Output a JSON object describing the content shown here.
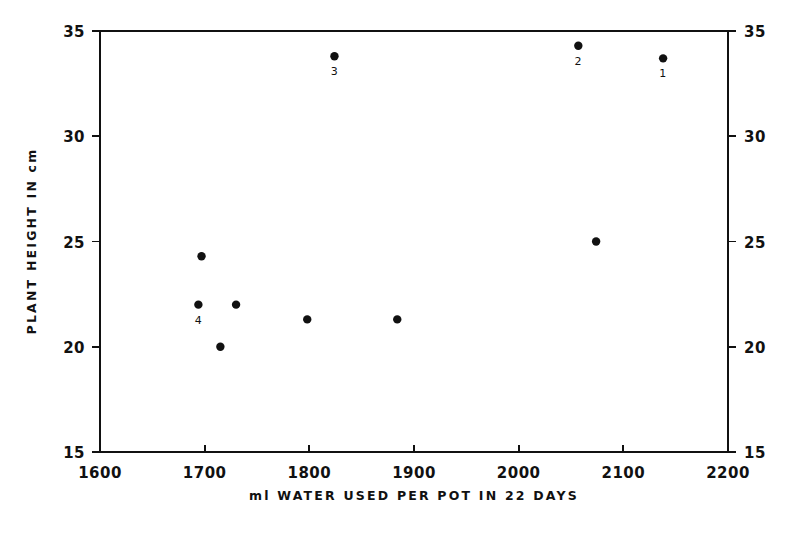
{
  "chart_data": {
    "type": "scatter",
    "title": "",
    "xlabel": "ml WATER USED PER POT IN 22 DAYS",
    "ylabel": "PLANT HEIGHT IN cm",
    "xlim": [
      1600,
      2200
    ],
    "ylim": [
      15,
      35
    ],
    "xticks": [
      1600,
      1700,
      1800,
      1900,
      2000,
      2100,
      2200
    ],
    "xticklabels": [
      "1600",
      "1700",
      "1800",
      "1900",
      "2000",
      "2100",
      "2200"
    ],
    "yticks": [
      15,
      20,
      25,
      30,
      35
    ],
    "yticklabels": [
      "15",
      "20",
      "25",
      "30",
      "35"
    ],
    "yticklabels_right": [
      "15",
      "20",
      "25",
      "30",
      "35"
    ],
    "grid": false,
    "legend": null,
    "marker_color": "#111111",
    "axis_color": "#111111",
    "background_color": "#ffffff",
    "points": [
      {
        "x": 1824,
        "y": 33.8,
        "label": "3"
      },
      {
        "x": 2057,
        "y": 34.3,
        "label": "2"
      },
      {
        "x": 2138,
        "y": 33.7,
        "label": "1"
      },
      {
        "x": 2074,
        "y": 25.0,
        "label": ""
      },
      {
        "x": 1697,
        "y": 24.3,
        "label": ""
      },
      {
        "x": 1694,
        "y": 22.0,
        "label": "4"
      },
      {
        "x": 1730,
        "y": 22.0,
        "label": ""
      },
      {
        "x": 1798,
        "y": 21.3,
        "label": ""
      },
      {
        "x": 1884,
        "y": 21.3,
        "label": ""
      },
      {
        "x": 1715,
        "y": 20.0,
        "label": ""
      }
    ]
  }
}
